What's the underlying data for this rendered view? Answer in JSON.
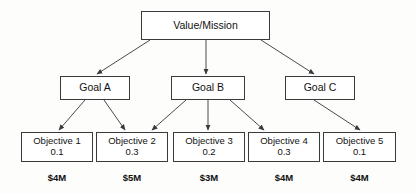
{
  "diagram": {
    "type": "hierarchy-tree",
    "colors": {
      "background": "#fdfdfb",
      "box_fill": "#ffffff",
      "box_border": "#3a3a3a",
      "text": "#111111",
      "edge": "#4a4a4a"
    },
    "root": {
      "id": "value-mission",
      "label": "Value/Mission",
      "x": 141,
      "y": 11,
      "w": 129,
      "h": 29
    },
    "goals": [
      {
        "id": "goal-a",
        "label": "Goal A",
        "x": 60,
        "y": 76,
        "w": 70,
        "h": 24
      },
      {
        "id": "goal-b",
        "label": "Goal B",
        "x": 171,
        "y": 76,
        "w": 74,
        "h": 24
      },
      {
        "id": "goal-c",
        "label": "Goal C",
        "x": 285,
        "y": 76,
        "w": 70,
        "h": 24
      }
    ],
    "objectives": [
      {
        "id": "objective-1",
        "label": "Objective 1",
        "weight": "0.1",
        "cost": "$4M",
        "x": 21,
        "y": 132,
        "w": 72,
        "h": 30
      },
      {
        "id": "objective-2",
        "label": "Objective 2",
        "weight": "0.3",
        "cost": "$5M",
        "x": 96,
        "y": 132,
        "w": 72,
        "h": 30
      },
      {
        "id": "objective-3",
        "label": "Objective 3",
        "weight": "0.2",
        "cost": "$3M",
        "x": 173,
        "y": 132,
        "w": 72,
        "h": 30
      },
      {
        "id": "objective-4",
        "label": "Objective 4",
        "weight": "0.3",
        "cost": "$4M",
        "x": 248,
        "y": 132,
        "w": 72,
        "h": 30
      },
      {
        "id": "objective-5",
        "label": "Objective 5",
        "weight": "0.1",
        "cost": "$4M",
        "x": 323,
        "y": 132,
        "w": 73,
        "h": 30
      }
    ],
    "cost_labels": [
      {
        "id": "cost-1",
        "text": "$4M",
        "x": 21,
        "y": 172,
        "w": 72
      },
      {
        "id": "cost-2",
        "text": "$5M",
        "x": 96,
        "y": 172,
        "w": 72
      },
      {
        "id": "cost-3",
        "text": "$3M",
        "x": 173,
        "y": 172,
        "w": 72
      },
      {
        "id": "cost-4",
        "text": "$4M",
        "x": 248,
        "y": 172,
        "w": 72
      },
      {
        "id": "cost-5",
        "text": "$4M",
        "x": 323,
        "y": 172,
        "w": 73
      }
    ],
    "edges": [
      {
        "id": "edge-root-goal-a",
        "from": "value-mission",
        "to": "goal-a",
        "x1": 150,
        "y1": 40,
        "x2": 97,
        "y2": 74
      },
      {
        "id": "edge-root-goal-b",
        "from": "value-mission",
        "to": "goal-b",
        "x1": 206,
        "y1": 40,
        "x2": 206,
        "y2": 74
      },
      {
        "id": "edge-root-goal-c",
        "from": "value-mission",
        "to": "goal-c",
        "x1": 261,
        "y1": 40,
        "x2": 314,
        "y2": 74
      },
      {
        "id": "edge-goal-a-objective-1",
        "from": "goal-a",
        "to": "objective-1",
        "x1": 85,
        "y1": 100,
        "x2": 59,
        "y2": 130
      },
      {
        "id": "edge-goal-a-objective-2",
        "from": "goal-a",
        "to": "objective-2",
        "x1": 104,
        "y1": 100,
        "x2": 125,
        "y2": 130
      },
      {
        "id": "edge-goal-b-objective-2",
        "from": "goal-b",
        "to": "objective-2",
        "x1": 186,
        "y1": 100,
        "x2": 152,
        "y2": 130
      },
      {
        "id": "edge-goal-b-objective-3",
        "from": "goal-b",
        "to": "objective-3",
        "x1": 208,
        "y1": 100,
        "x2": 208,
        "y2": 130
      },
      {
        "id": "edge-goal-b-objective-4",
        "from": "goal-b",
        "to": "objective-4",
        "x1": 230,
        "y1": 100,
        "x2": 264,
        "y2": 130
      },
      {
        "id": "edge-goal-c-objective-5",
        "from": "goal-c",
        "to": "objective-5",
        "x1": 314,
        "y1": 100,
        "x2": 360,
        "y2": 130
      }
    ]
  }
}
